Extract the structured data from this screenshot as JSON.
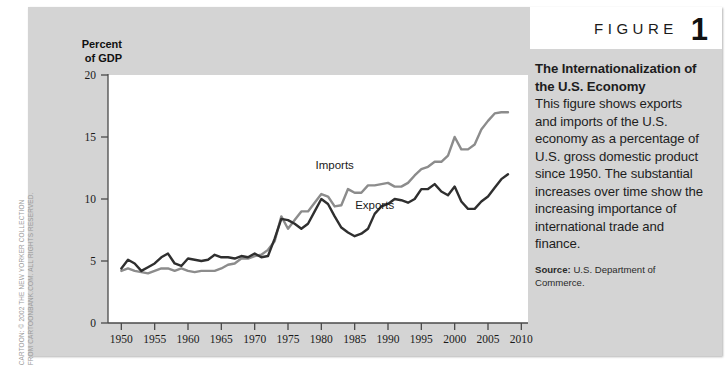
{
  "figure": {
    "word": "FIGURE",
    "number": "1"
  },
  "caption": {
    "title": "The Internationalization of the U.S. Economy",
    "body": "This figure shows exports and imports of the U.S. economy as a percentage of U.S. gross domestic product since 1950. The substantial increases over time show the increasing importance of international trade and finance.",
    "source_label": "Source:",
    "source_text": "U.S. Department of Commerce."
  },
  "credit": {
    "line1": "CARTOON: © 2002 THE NEW YORKER COLLECTION",
    "line2": "FROM CARTOONBANK.COM. ALL RIGHTS RESERVED."
  },
  "chart_data": {
    "type": "line",
    "title": "The Internationalization of the U.S. Economy",
    "xlabel": "",
    "ylabel": "Percent of GDP",
    "ylim": [
      0,
      20
    ],
    "xlim": [
      1948,
      2011
    ],
    "yticks": [
      0,
      5,
      10,
      15,
      20
    ],
    "xticks": [
      1950,
      1955,
      1960,
      1965,
      1970,
      1975,
      1980,
      1985,
      1990,
      1995,
      2000,
      2005,
      2010
    ],
    "grid": false,
    "legend": "inline-annotations",
    "annotations": [
      {
        "text": "Imports",
        "x": 1982,
        "y": 12.4
      },
      {
        "text": "Exports",
        "x": 1988,
        "y": 9.2
      }
    ],
    "x": [
      1950,
      1951,
      1952,
      1953,
      1954,
      1955,
      1956,
      1957,
      1958,
      1959,
      1960,
      1961,
      1962,
      1963,
      1964,
      1965,
      1966,
      1967,
      1968,
      1969,
      1970,
      1971,
      1972,
      1973,
      1974,
      1975,
      1976,
      1977,
      1978,
      1979,
      1980,
      1981,
      1982,
      1983,
      1984,
      1985,
      1986,
      1987,
      1988,
      1989,
      1990,
      1991,
      1992,
      1993,
      1994,
      1995,
      1996,
      1997,
      1998,
      1999,
      2000,
      2001,
      2002,
      2003,
      2004,
      2005,
      2006,
      2007,
      2008
    ],
    "series": [
      {
        "name": "Imports",
        "color": "#8c8c8c",
        "values": [
          4.2,
          4.4,
          4.2,
          4.1,
          4.0,
          4.2,
          4.4,
          4.4,
          4.2,
          4.4,
          4.2,
          4.1,
          4.2,
          4.2,
          4.2,
          4.4,
          4.7,
          4.8,
          5.2,
          5.2,
          5.4,
          5.5,
          5.9,
          6.6,
          8.6,
          7.6,
          8.3,
          9.0,
          9.0,
          9.7,
          10.4,
          10.2,
          9.4,
          9.5,
          10.8,
          10.5,
          10.5,
          11.1,
          11.1,
          11.2,
          11.3,
          11.0,
          11.0,
          11.3,
          11.9,
          12.4,
          12.6,
          13.0,
          13.0,
          13.5,
          15.0,
          14.0,
          14.0,
          14.4,
          15.6,
          16.3,
          16.9,
          17.0,
          17.0
        ]
      },
      {
        "name": "Exports",
        "color": "#2f2f2f",
        "values": [
          4.4,
          5.1,
          4.8,
          4.2,
          4.5,
          4.8,
          5.3,
          5.6,
          4.8,
          4.6,
          5.2,
          5.1,
          5.0,
          5.1,
          5.5,
          5.3,
          5.3,
          5.2,
          5.4,
          5.3,
          5.6,
          5.3,
          5.4,
          6.8,
          8.4,
          8.3,
          8.0,
          7.6,
          8.0,
          9.0,
          10.0,
          9.6,
          8.6,
          7.7,
          7.3,
          7.0,
          7.2,
          7.6,
          8.8,
          9.4,
          9.6,
          10.0,
          9.9,
          9.7,
          10.0,
          10.8,
          10.8,
          11.2,
          10.6,
          10.3,
          11.0,
          9.8,
          9.2,
          9.2,
          9.8,
          10.2,
          10.9,
          11.6,
          12.0
        ]
      }
    ]
  }
}
